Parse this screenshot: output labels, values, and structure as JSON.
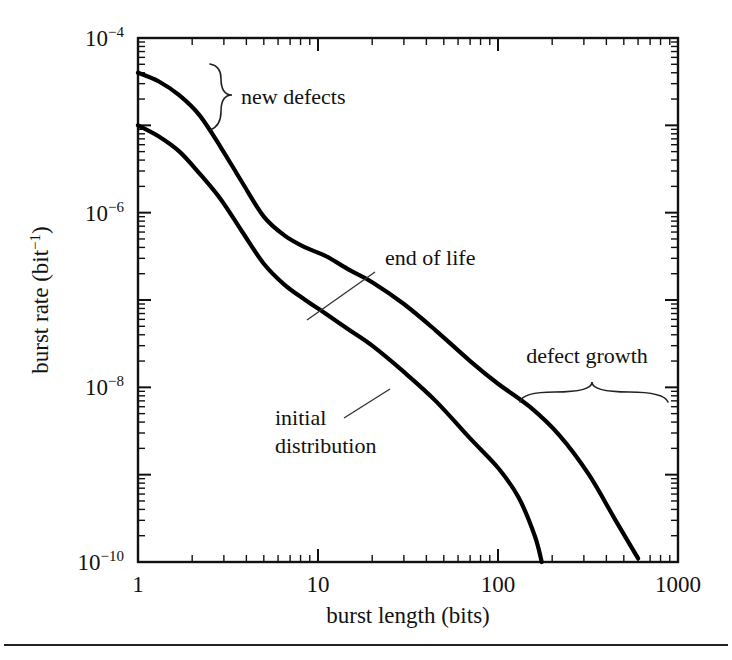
{
  "figure": {
    "name": "burst-rate-vs-burst-length",
    "background": "#ffffff",
    "ink_color": "#000000",
    "bottom_rule": true
  },
  "chart_data": {
    "type": "line",
    "title": "",
    "xlabel": "burst length (bits)",
    "ylabel": "burst rate (bit−1)",
    "ylabel_base": "burst rate (bit",
    "ylabel_exp": "−1",
    "ylabel_tail": ")",
    "xscale": "log",
    "yscale": "log",
    "xlim": [
      1,
      1000
    ],
    "ylim": [
      1e-10,
      0.0001
    ],
    "grid": false,
    "legend": "none",
    "xticks": [
      1,
      10,
      100,
      1000
    ],
    "xtick_labels": [
      "1",
      "10",
      "100",
      "1000"
    ],
    "yticks": [
      0.0001,
      1e-06,
      1e-08,
      1e-10
    ],
    "ytick_labels": [
      "10−4",
      "10−6",
      "10−8",
      "10−10"
    ],
    "ytick_mantissa": "10",
    "ytick_exponents": [
      "−4",
      "−6",
      "−8",
      "−10"
    ],
    "series": [
      {
        "name": "end of life",
        "label": "end of life",
        "x": [
          1,
          1.3,
          1.7,
          2.2,
          2.9,
          3.8,
          5,
          6.5,
          8.5,
          11,
          15,
          20,
          30,
          45,
          70,
          100,
          150,
          220,
          320,
          450,
          600
        ],
        "y": [
          4e-05,
          3.2e-05,
          2.2e-05,
          1.3e-05,
          5.5e-06,
          2.2e-06,
          9e-07,
          5.5e-07,
          4e-07,
          3.2e-07,
          2.2e-07,
          1.6e-07,
          9e-08,
          4.5e-08,
          2e-08,
          1.1e-08,
          6e-09,
          2.8e-09,
          1e-09,
          3e-10,
          1.1e-10
        ]
      },
      {
        "name": "initial distribution",
        "label": "initial distribution",
        "x": [
          1,
          1.3,
          1.7,
          2.2,
          2.9,
          3.8,
          5,
          6.5,
          8.5,
          11,
          15,
          20,
          30,
          45,
          70,
          100,
          130,
          160,
          175
        ],
        "y": [
          1e-05,
          7.5e-06,
          5e-06,
          2.8e-06,
          1.4e-06,
          6e-07,
          2.6e-07,
          1.5e-07,
          1e-07,
          7e-08,
          4.5e-08,
          3e-08,
          1.5e-08,
          7e-09,
          2.6e-09,
          1.2e-09,
          5.5e-10,
          2e-10,
          1e-10
        ]
      }
    ],
    "annotations": [
      {
        "name": "new-defects",
        "text": "new defects",
        "kind": "vertical-brace",
        "text_x": 241,
        "text_y": 104,
        "brace_x": 221,
        "brace_y0": 64,
        "brace_y1": 130
      },
      {
        "name": "end-of-life",
        "text": "end of life",
        "kind": "leader",
        "text_x": 385,
        "text_y": 265,
        "leader_x0": 375,
        "leader_y0": 272,
        "leader_x1": 307,
        "leader_y1": 320
      },
      {
        "name": "initial-distribution",
        "text_line1": "initial",
        "text_line2": "distribution",
        "kind": "leader-two-line",
        "text_x": 275,
        "text_y1": 425,
        "text_y2": 453,
        "leader_x0": 344,
        "leader_y0": 418,
        "leader_x1": 390,
        "leader_y1": 389
      },
      {
        "name": "defect-growth",
        "text": "defect growth",
        "kind": "horizontal-brace",
        "text_x": 587,
        "text_y": 363,
        "brace_x0": 520,
        "brace_x1": 668,
        "brace_y": 392
      }
    ]
  }
}
